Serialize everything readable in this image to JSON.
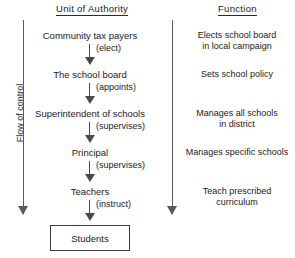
{
  "diagram": {
    "flow_label": "Flow of control",
    "headers": {
      "authority": "Unit of Authority",
      "function": "Function"
    },
    "authority_units": [
      {
        "label": "Community tax payers"
      },
      {
        "label": "The school board"
      },
      {
        "label": "Superintendent of schools"
      },
      {
        "label": "Principal"
      },
      {
        "label": "Teachers"
      }
    ],
    "relations": [
      {
        "verb": "(elect)"
      },
      {
        "verb": "(appoints)"
      },
      {
        "verb": "(supervises)"
      },
      {
        "verb": "(supervises)"
      },
      {
        "verb": "(instruct)"
      }
    ],
    "terminal": {
      "label": "Students"
    },
    "functions": [
      {
        "line1": "Elects school board",
        "line2": "in local campaign"
      },
      {
        "line1": "Sets school policy",
        "line2": ""
      },
      {
        "line1": "Manages all schools",
        "line2": "in district"
      },
      {
        "line1": "Manages specific schools",
        "line2": ""
      },
      {
        "line1": "Teach prescribed",
        "line2": "curriculum"
      }
    ],
    "colors": {
      "background": "#ffffff",
      "text": "#1a1a1a",
      "rule": "#2b2b2b",
      "arrow": "#4a4a4a",
      "flow_arrow": "#5a5a5a",
      "box_border": "#3a3a3a"
    }
  }
}
